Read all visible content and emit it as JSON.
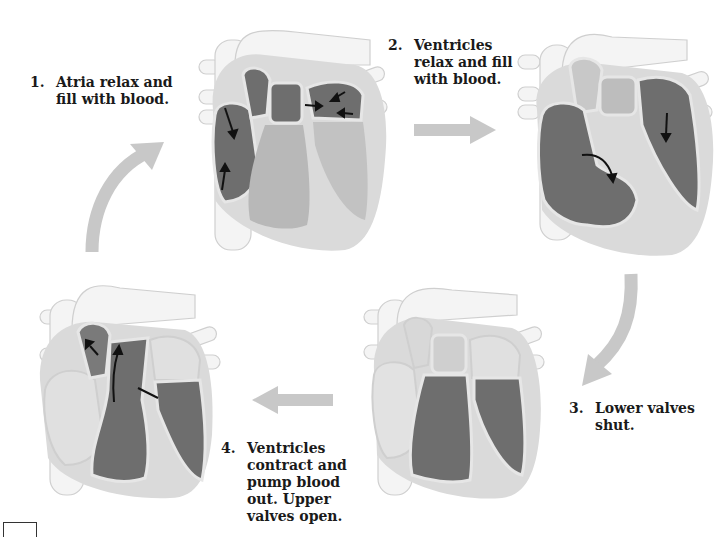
{
  "diagram": {
    "colors": {
      "background": "#ffffff",
      "heart_wall": "#dadada",
      "vessel": "#f4f4f4",
      "vessel_outline": "#cfcfcf",
      "chamber_filled": "#6e6e6e",
      "chamber_empty_light": "#e6e6e6",
      "chamber_empty_dark": "#b4b4b4",
      "flow_arrow": "#c8c8c8",
      "blood_arrow": "#111111",
      "text": "#1a1a1a"
    },
    "steps": [
      {
        "number": "1.",
        "lines": [
          "Atria relax and",
          "fill with blood."
        ],
        "heart_state": "atria-filling"
      },
      {
        "number": "2.",
        "lines": [
          "Ventricles",
          "relax and fill",
          "with blood."
        ],
        "heart_state": "ventricles-filling"
      },
      {
        "number": "3.",
        "lines": [
          "Lower valves",
          "shut."
        ],
        "heart_state": "lower-valves-shut"
      },
      {
        "number": "4.",
        "lines": [
          "Ventricles",
          "contract and",
          "pump blood",
          "out. Upper",
          "valves open."
        ],
        "heart_state": "ventricles-contracting"
      }
    ],
    "flow_arrows": [
      {
        "from": "step-4",
        "to": "step-1",
        "shape": "curved-up"
      },
      {
        "from": "step-1",
        "to": "step-2",
        "shape": "straight-right"
      },
      {
        "from": "step-2",
        "to": "step-3",
        "shape": "curved-down"
      },
      {
        "from": "step-3",
        "to": "step-4",
        "shape": "straight-left"
      }
    ]
  }
}
